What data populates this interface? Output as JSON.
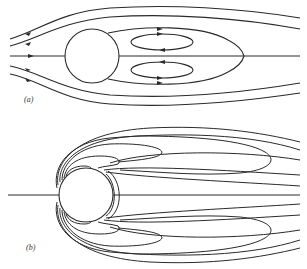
{
  "figure": {
    "panels": [
      {
        "id": "a",
        "label": "(a)",
        "description": "Low Reynolds number flow past a cylinder with a pair of attached recirculating eddies in the wake"
      },
      {
        "id": "b",
        "label": "(b)",
        "description": "Streamline pattern around a cylinder showing boundary-layer separation and elongated closed wake streamlines"
      }
    ],
    "colors": {
      "stroke": "#2a2a2a",
      "background": "#ffffff"
    }
  }
}
